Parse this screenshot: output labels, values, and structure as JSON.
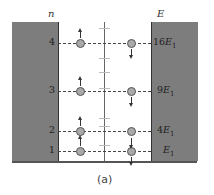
{
  "axis": {
    "left_label": "n",
    "right_label": "E"
  },
  "levels": [
    {
      "n": "4",
      "energy_coef": "16",
      "energy_sym": "E",
      "energy_sub": "1",
      "y": 43
    },
    {
      "n": "3",
      "energy_coef": "9",
      "energy_sym": "E",
      "energy_sub": "1",
      "y": 91
    },
    {
      "n": "2",
      "energy_coef": "4",
      "energy_sym": "E",
      "energy_sub": "1",
      "y": 131
    },
    {
      "n": "1",
      "energy_coef": "",
      "energy_sym": "E",
      "energy_sub": "1",
      "y": 151
    }
  ],
  "caption": "(a)",
  "colors": {
    "wall": "#7d7d7d",
    "particle": "#a9a9a9",
    "line": "#444444"
  }
}
